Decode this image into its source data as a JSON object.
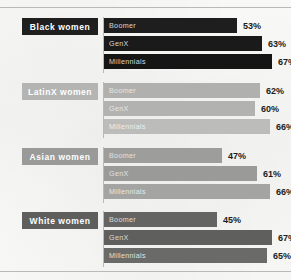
{
  "chart_data": {
    "type": "bar",
    "title": "",
    "subtitle": "",
    "xlabel": "",
    "ylabel": "",
    "orientation": "horizontal",
    "grid": false,
    "legend_position": "none",
    "value_suffix": "%",
    "xlim": [
      0,
      100
    ],
    "categories": [
      "Black women",
      "LatinX women",
      "Asian women",
      "White women"
    ],
    "series": [
      {
        "name": "Boomer",
        "values": [
          53,
          62,
          47,
          45
        ]
      },
      {
        "name": "GenX",
        "values": [
          63,
          60,
          61,
          67
        ]
      },
      {
        "name": "Millennials",
        "values": [
          67,
          66,
          66,
          65
        ]
      }
    ],
    "groups": [
      {
        "category": "Black women",
        "chip_bg": "#1f1f1f",
        "chip_text_color": "#ffffff",
        "bars": [
          {
            "series": "Boomer",
            "value": 53,
            "value_label": "53%",
            "bar_color": "#1e1e1e",
            "bar_label_color": "#d8d8d8"
          },
          {
            "series": "GenX",
            "value": 63,
            "value_label": "63%",
            "bar_color": "#1a1a1a",
            "bar_label_color": "#d8d8d8"
          },
          {
            "series": "Millennials",
            "value": 67,
            "value_label": "67%",
            "bar_color": "#151515",
            "bar_label_color": "#d8d8d8"
          }
        ]
      },
      {
        "category": "LatinX women",
        "chip_bg": "#b4b4b2",
        "chip_text_color": "#ffffff",
        "bars": [
          {
            "series": "Boomer",
            "value": 62,
            "value_label": "62%",
            "bar_color": "#b0b0ae",
            "bar_label_color": "#e6e6e4"
          },
          {
            "series": "GenX",
            "value": 60,
            "value_label": "60%",
            "bar_color": "#b2b2b0",
            "bar_label_color": "#e6e6e4"
          },
          {
            "series": "Millennials",
            "value": 66,
            "value_label": "66%",
            "bar_color": "#bcbcba",
            "bar_label_color": "#eeeeec"
          }
        ]
      },
      {
        "category": "Asian women",
        "chip_bg": "#9a9a98",
        "chip_text_color": "#ffffff",
        "bars": [
          {
            "series": "Boomer",
            "value": 47,
            "value_label": "47%",
            "bar_color": "#9d9d9b",
            "bar_label_color": "#e2e2e0"
          },
          {
            "series": "GenX",
            "value": 61,
            "value_label": "61%",
            "bar_color": "#9a9a98",
            "bar_label_color": "#e2e2e0"
          },
          {
            "series": "Millennials",
            "value": 66,
            "value_label": "66%",
            "bar_color": "#a4a4a2",
            "bar_label_color": "#e8e8e6"
          }
        ]
      },
      {
        "category": "White women",
        "chip_bg": "#5e5e5c",
        "chip_text_color": "#ffffff",
        "bars": [
          {
            "series": "Boomer",
            "value": 45,
            "value_label": "45%",
            "bar_color": "#646462",
            "bar_label_color": "#dcdcda"
          },
          {
            "series": "GenX",
            "value": 67,
            "value_label": "67%",
            "bar_color": "#5f5f5d",
            "bar_label_color": "#dcdcda"
          },
          {
            "series": "Millennials",
            "value": 65,
            "value_label": "65%",
            "bar_color": "#6a6a68",
            "bar_label_color": "#e0e0de"
          }
        ]
      }
    ]
  },
  "layout": {
    "group_tops": [
      18,
      83,
      148,
      212
    ],
    "bar_area_left": 104,
    "bar_area_width": 155,
    "rule_color": "#b9b9b7"
  }
}
